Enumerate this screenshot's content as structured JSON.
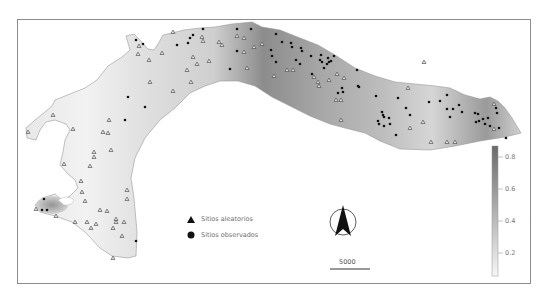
{
  "map": {
    "type": "interpolation-surface",
    "colormap": {
      "low": "#f4f4f4",
      "high": "#6e6e6e"
    }
  },
  "legend": {
    "items": [
      {
        "symbol": "triangle",
        "label": "Sitios aleatorios"
      },
      {
        "symbol": "circle",
        "label": "Sitios observados"
      }
    ]
  },
  "north_arrow": {
    "icon": "north-arrow-icon"
  },
  "scale_bar": {
    "label": "5000"
  },
  "colorbar": {
    "ticks": [
      "0.8",
      "0.6",
      "0.4",
      "0.2"
    ],
    "colors": {
      "top": "#6a6a6a",
      "bottom": "#f6f6f6"
    }
  }
}
